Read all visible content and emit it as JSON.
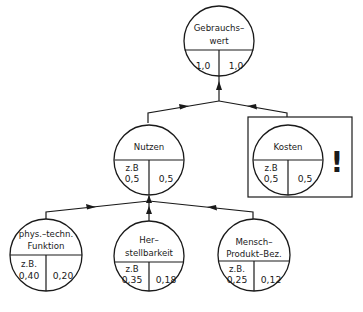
{
  "diagram": {
    "type": "value-tree",
    "nodes": {
      "root": {
        "label_line1": "Gebrauchs–",
        "label_line2": "wert",
        "left_value": "1,0",
        "right_value": "1,0"
      },
      "nutzen": {
        "label": "Nutzen",
        "example": "z.B",
        "left_value": "0,5",
        "right_value": "0,5"
      },
      "kosten": {
        "label": "Kosten",
        "example": "z.B",
        "left_value": "0,5",
        "right_value": "0,5",
        "highlight_mark": "!"
      },
      "funktion": {
        "label_line1": "phys.–techn.",
        "label_line2": "Funktion",
        "example": "z.B.",
        "left_value": "0,40",
        "right_value": "0,20"
      },
      "herstellbarkeit": {
        "label_line1": "Her–",
        "label_line2": "stellbarkeit",
        "example": "z.B",
        "left_value": "0,35",
        "right_value": "0,18"
      },
      "mensch": {
        "label_line1": "Mensch–",
        "label_line2": "Produkt–Bez.",
        "example": "z.B.",
        "left_value": "0,25",
        "right_value": "0,12"
      }
    },
    "edges": [
      {
        "from": "nutzen",
        "to": "root"
      },
      {
        "from": "kosten",
        "to": "root"
      },
      {
        "from": "funktion",
        "to": "nutzen"
      },
      {
        "from": "herstellbarkeit",
        "to": "nutzen"
      },
      {
        "from": "mensch",
        "to": "nutzen"
      }
    ]
  }
}
